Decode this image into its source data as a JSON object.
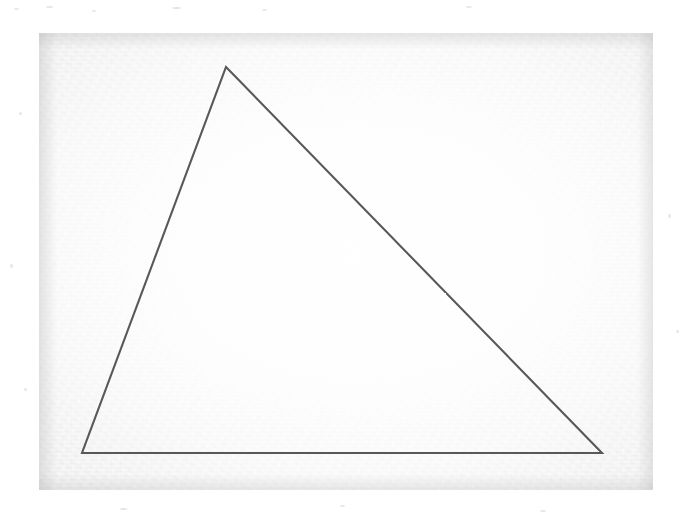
{
  "figure": {
    "kind": "scanned-geometry-figure",
    "medium": "photocopy / scan of line drawing",
    "canvas": {
      "width": 693,
      "height": 518,
      "background_color": "#ffffff"
    },
    "scan_area": {
      "name": "paper-region",
      "x": 39,
      "y": 33,
      "width": 614,
      "height": 457,
      "paper_color": "#ededed",
      "interior_color": "#fbfbfb",
      "texture": "grainy speckled toner noise"
    },
    "margin": {
      "name": "outer-margin",
      "color": "#ffffff",
      "left": 39,
      "top": 33,
      "right": 40,
      "bottom": 28
    }
  },
  "shape_data": {
    "type": "polygon",
    "name": "triangle",
    "sides": 3,
    "stroke_color": "#595959",
    "stroke_width": 2.1,
    "fill": "none",
    "closed": true,
    "vertices": [
      {
        "label": "apex",
        "name": "vertex-apex",
        "x": 226,
        "y": 67
      },
      {
        "label": "bottom-right",
        "name": "vertex-bottom-right",
        "x": 602,
        "y": 453
      },
      {
        "label": "bottom-left",
        "name": "vertex-bottom-left",
        "x": 82,
        "y": 453
      }
    ],
    "edges": [
      {
        "name": "edge-left",
        "from": "bottom-left",
        "to": "apex",
        "length_px": 412
      },
      {
        "name": "edge-hypotenuse",
        "from": "apex",
        "to": "bottom-right",
        "length_px": 539
      },
      {
        "name": "edge-base",
        "from": "bottom-left",
        "to": "bottom-right",
        "length_px": 520
      }
    ],
    "points_path": "226,67 602,453 82,453"
  },
  "labels": {
    "visible_text": "",
    "annotations": []
  }
}
